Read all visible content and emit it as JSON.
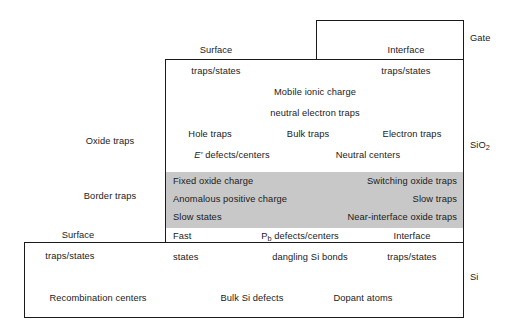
{
  "figure": {
    "type": "layered-block-diagram",
    "colors": {
      "outline": "#1a1a1a",
      "border_trap_band": "#c8c8c8",
      "background": "#ffffff",
      "text": "#1a1a1a"
    }
  },
  "regions": {
    "gate": {
      "label": "Gate"
    },
    "oxide": {
      "label_line1": "SiO",
      "label_sub": "2",
      "label_full": "SiO2"
    },
    "silicon": {
      "label": "Si"
    }
  },
  "left_labels": {
    "oxide_traps": "Oxide traps",
    "border_traps": "Border traps",
    "surface": "Surface",
    "surface_traps_states": "traps/states",
    "recombination_centers": "Recombination centers"
  },
  "interface_top": {
    "surface": "Surface",
    "interface": "Interface",
    "surface_traps_states": "traps/states",
    "interface_traps_states": "traps/states"
  },
  "oxide_bulk": {
    "mobile_ionic_charge": "Mobile ionic charge",
    "neutral_electron_traps": "neutral electron traps",
    "hole_traps": "Hole traps",
    "bulk_traps": "Bulk traps",
    "electron_traps": "Electron traps",
    "e_prime_defects": "E′ defects/centers",
    "e_prime_symbol": "E′",
    "e_prime_rest": " defects/centers",
    "neutral_centers": "Neutral centers"
  },
  "border_trap_band": {
    "fixed_oxide_charge": "Fixed oxide charge",
    "switching_oxide_traps": "Switching oxide traps",
    "anomalous_positive_charge": "Anomalous positive charge",
    "slow_traps": "Slow traps",
    "slow_states": "Slow states",
    "near_interface_oxide_traps": "Near-interface oxide traps"
  },
  "interface_bottom": {
    "fast": "Fast",
    "pb_symbol": "P",
    "pb_sub": "b",
    "pb_rest": " defects/centers",
    "pb_defects": "Pb defects/centers",
    "interface": "Interface",
    "states": "states",
    "dangling_si_bonds": "dangling Si bonds",
    "traps_states": "traps/states"
  },
  "silicon_bulk": {
    "bulk_si_defects": "Bulk Si defects",
    "dopant_atoms": "Dopant atoms"
  }
}
